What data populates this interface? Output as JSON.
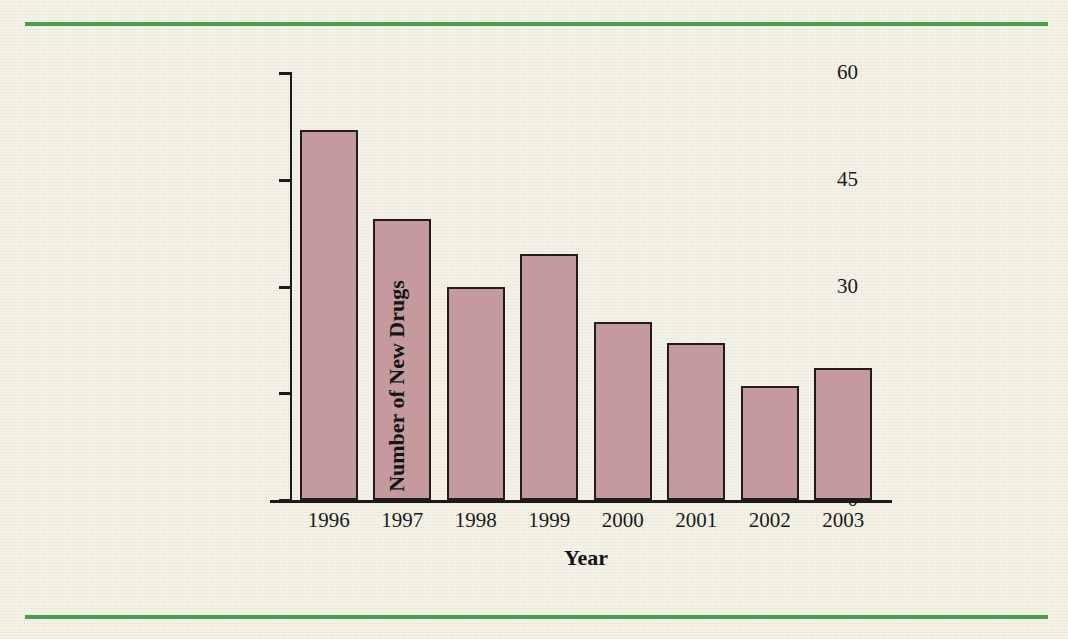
{
  "figure": {
    "background_color": "#f4f3e7",
    "rule_color": "#4a9c4e",
    "bar_fill_color": "#c49a9d",
    "bar_edge_color": "#231a1a",
    "axis_color": "#1b1b1b"
  },
  "chart_data": {
    "type": "bar",
    "title": "",
    "xlabel": "Year",
    "ylabel": "Number of New Drugs",
    "categories": [
      "1996",
      "1997",
      "1998",
      "1999",
      "2000",
      "2001",
      "2002",
      "2003"
    ],
    "values": [
      52,
      39.5,
      30,
      34.5,
      25,
      22,
      16,
      18.5
    ],
    "ylim": [
      0,
      60
    ],
    "yticks": [
      0,
      15,
      30,
      45,
      60
    ],
    "ytick_labels": [
      "0",
      "15",
      "30",
      "45",
      "60"
    ],
    "grid": false,
    "legend": null
  }
}
